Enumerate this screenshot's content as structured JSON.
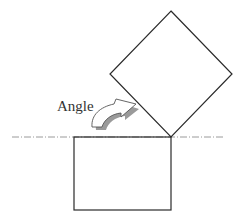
{
  "diagram": {
    "label": "Angle",
    "colors": {
      "stroke": "#2a2a2a",
      "axis": "#9a9a9a",
      "arrow_fill": "#ffffff",
      "arrow_shadow": "#9a9a9a",
      "label": "#333333"
    },
    "shapes": {
      "rotated_square": {
        "top": [
          171,
          11
        ],
        "right": [
          232,
          74
        ],
        "bottom": [
          171,
          137
        ],
        "left": [
          110,
          74
        ]
      },
      "base_rectangle": {
        "x": 74,
        "y": 137,
        "width": 97,
        "height": 73
      },
      "reference_line": {
        "y": 137,
        "x1": 12,
        "x2": 224,
        "style": "dash-dot"
      }
    }
  }
}
